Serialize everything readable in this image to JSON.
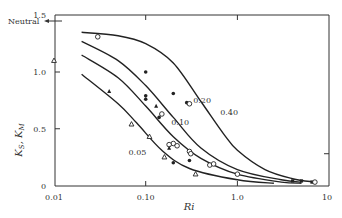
{
  "chart_data": {
    "type": "line",
    "title": "",
    "xlabel": "Ri",
    "ylabel": "K_S, K_M",
    "xscale": "log",
    "xlim": [
      0.01,
      10
    ],
    "ylim": [
      0,
      1.5
    ],
    "x_ticks": [
      {
        "v": 0.01,
        "label": "0.01"
      },
      {
        "v": 0.1,
        "label": "0.10"
      },
      {
        "v": 1.0,
        "label": "1.0"
      },
      {
        "v": 10,
        "label": "10"
      }
    ],
    "y_ticks": [
      {
        "v": 0,
        "label": "0"
      },
      {
        "v": 0.5,
        "label": "0.5"
      },
      {
        "v": 1.0,
        "label": "1.0"
      },
      {
        "v": 1.5,
        "label": "1.5"
      }
    ],
    "annotation": {
      "label": "Neutral",
      "y": 1.45
    },
    "grid": false,
    "series": [
      {
        "name": "0.40",
        "label_at": [
          0.65,
          0.62
        ],
        "points": [
          [
            0.02,
            1.35
          ],
          [
            0.05,
            1.32
          ],
          [
            0.1,
            1.25
          ],
          [
            0.2,
            1.08
          ],
          [
            0.4,
            0.74
          ],
          [
            0.7,
            0.46
          ],
          [
            1.0,
            0.31
          ],
          [
            2.0,
            0.14
          ],
          [
            4.0,
            0.06
          ],
          [
            7.0,
            0.03
          ]
        ]
      },
      {
        "name": "0.20",
        "label_at": [
          0.33,
          0.73
        ],
        "points": [
          [
            0.02,
            1.27
          ],
          [
            0.05,
            1.1
          ],
          [
            0.1,
            0.88
          ],
          [
            0.2,
            0.6
          ],
          [
            0.4,
            0.33
          ],
          [
            1.0,
            0.14
          ],
          [
            3.0,
            0.05
          ],
          [
            5.0,
            0.03
          ]
        ]
      },
      {
        "name": "0.10",
        "label_at": [
          0.19,
          0.53
        ],
        "points": [
          [
            0.02,
            1.15
          ],
          [
            0.05,
            0.95
          ],
          [
            0.1,
            0.7
          ],
          [
            0.2,
            0.43
          ],
          [
            0.4,
            0.24
          ],
          [
            1.0,
            0.1
          ],
          [
            3.0,
            0.03
          ],
          [
            5.0,
            0.02
          ]
        ]
      },
      {
        "name": "0.05",
        "label_at": [
          0.065,
          0.27
        ],
        "points": [
          [
            0.02,
            0.98
          ],
          [
            0.05,
            0.72
          ],
          [
            0.08,
            0.55
          ],
          [
            0.15,
            0.31
          ],
          [
            0.3,
            0.15
          ],
          [
            1.0,
            0.05
          ],
          [
            2.5,
            0.02
          ]
        ]
      }
    ],
    "markers": [
      {
        "shape": "circle-open",
        "x": 0.03,
        "y": 1.31
      },
      {
        "shape": "triangle-open",
        "x": 0.01,
        "y": 1.1
      },
      {
        "shape": "circle-filled",
        "x": 0.1,
        "y": 1.0
      },
      {
        "shape": "circle-filled",
        "x": 0.2,
        "y": 0.81
      },
      {
        "shape": "circle-filled",
        "x": 0.28,
        "y": 0.73
      },
      {
        "shape": "circle-open",
        "x": 0.3,
        "y": 0.72
      },
      {
        "shape": "circle-filled",
        "x": 0.1,
        "y": 0.76
      },
      {
        "shape": "circle-filled",
        "x": 0.1,
        "y": 0.79
      },
      {
        "shape": "triangle-filled",
        "x": 0.13,
        "y": 0.7
      },
      {
        "shape": "circle-open",
        "x": 0.15,
        "y": 0.63
      },
      {
        "shape": "circle-filled",
        "x": 0.14,
        "y": 0.6
      },
      {
        "shape": "triangle-filled",
        "x": 0.04,
        "y": 0.83
      },
      {
        "shape": "triangle-open",
        "x": 0.07,
        "y": 0.54
      },
      {
        "shape": "triangle-open",
        "x": 0.11,
        "y": 0.43
      },
      {
        "shape": "triangle-open",
        "x": 0.16,
        "y": 0.25
      },
      {
        "shape": "circle-open",
        "x": 0.2,
        "y": 0.37
      },
      {
        "shape": "circle-open",
        "x": 0.22,
        "y": 0.35
      },
      {
        "shape": "circle-open",
        "x": 0.18,
        "y": 0.36
      },
      {
        "shape": "triangle-filled",
        "x": 0.18,
        "y": 0.33
      },
      {
        "shape": "circle-filled",
        "x": 0.2,
        "y": 0.2
      },
      {
        "shape": "circle-filled",
        "x": 0.3,
        "y": 0.22
      },
      {
        "shape": "circle-open",
        "x": 0.3,
        "y": 0.3
      },
      {
        "shape": "circle-open",
        "x": 0.31,
        "y": 0.28
      },
      {
        "shape": "triangle-open",
        "x": 0.35,
        "y": 0.1
      },
      {
        "shape": "circle-open",
        "x": 0.5,
        "y": 0.18
      },
      {
        "shape": "circle-open",
        "x": 0.55,
        "y": 0.19
      },
      {
        "shape": "circle-open",
        "x": 1.0,
        "y": 0.1
      },
      {
        "shape": "square-filled",
        "x": 4.0,
        "y": 0.04
      },
      {
        "shape": "square-filled",
        "x": 5.0,
        "y": 0.04
      },
      {
        "shape": "square-filled",
        "x": 6.5,
        "y": 0.03
      },
      {
        "shape": "circle-open",
        "x": 7.0,
        "y": 0.03
      }
    ]
  }
}
